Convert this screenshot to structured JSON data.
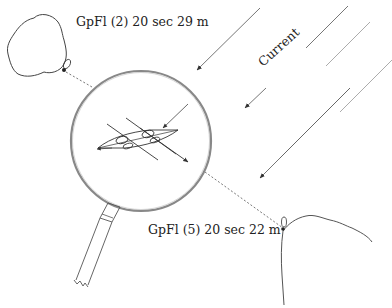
{
  "diagram": {
    "labels": {
      "light_left": "GpFl (2) 20 sec 29 m",
      "light_right": "GpFl (5) 20 sec 22 m",
      "current": "Current"
    },
    "elements": {
      "left_island": "rocky-islet-with-light",
      "right_coast": "coastline-with-light",
      "magnifier": "magnifying-glass-showing-boat-with-crossed-bearings",
      "current_arrows": 4
    },
    "colors": {
      "stroke": "#333333",
      "background": "#ffffff"
    }
  }
}
